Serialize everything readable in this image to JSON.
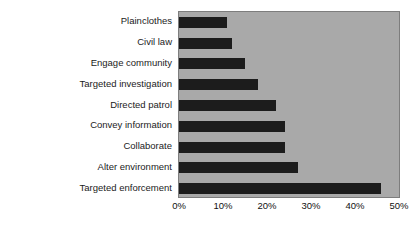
{
  "chart_data": {
    "type": "bar",
    "orientation": "horizontal",
    "title": "",
    "subtitle": "",
    "xlabel": "",
    "ylabel": "",
    "categories": [
      "Plainclothes",
      "Civil law",
      "Engage community",
      "Targeted investigation",
      "Directed patrol",
      "Convey information",
      "Collaborate",
      "Alter environment",
      "Targeted enforcement"
    ],
    "values": [
      11,
      12,
      15,
      18,
      22,
      24,
      24,
      27,
      46
    ],
    "value_unit": "%",
    "xlim": [
      0,
      50
    ],
    "xticks": [
      0,
      10,
      20,
      30,
      40,
      50
    ],
    "xtick_labels": [
      "0%",
      "10%",
      "20%",
      "30%",
      "40%",
      "50%"
    ],
    "grid": false,
    "legend": false,
    "bar_color": "#1c1c1c",
    "plot_background_color": "#a9a9a9",
    "figure_background_color": "#ffffff"
  }
}
